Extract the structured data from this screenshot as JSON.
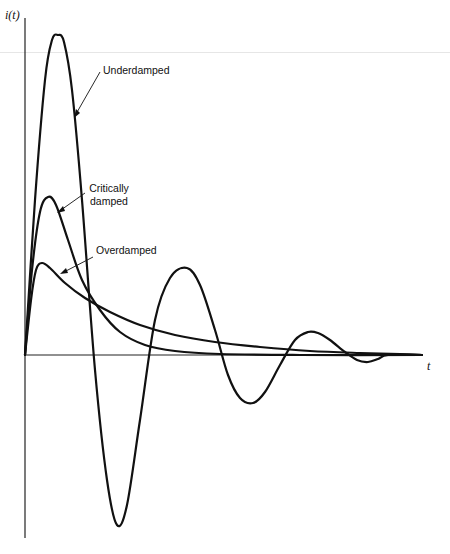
{
  "chart_data": {
    "type": "line",
    "title": "",
    "xlabel": "t",
    "ylabel": "i(t)",
    "grid": false,
    "legend": "annotations with arrows",
    "series": [
      {
        "name": "Underdamped",
        "description": "large oscillation decaying to zero",
        "points_px": [
          [
            25,
            355
          ],
          [
            35,
            200
          ],
          [
            45,
            80
          ],
          [
            52,
            40
          ],
          [
            58,
            35
          ],
          [
            64,
            42
          ],
          [
            72,
            90
          ],
          [
            82,
            200
          ],
          [
            95,
            370
          ],
          [
            107,
            480
          ],
          [
            117,
            525
          ],
          [
            127,
            505
          ],
          [
            140,
            420
          ],
          [
            155,
            320
          ],
          [
            170,
            278
          ],
          [
            187,
            268
          ],
          [
            200,
            285
          ],
          [
            215,
            330
          ],
          [
            228,
            375
          ],
          [
            240,
            398
          ],
          [
            253,
            403
          ],
          [
            265,
            392
          ],
          [
            280,
            365
          ],
          [
            295,
            340
          ],
          [
            308,
            332
          ],
          [
            318,
            333
          ],
          [
            330,
            340
          ],
          [
            345,
            352
          ],
          [
            357,
            360
          ],
          [
            368,
            362
          ],
          [
            378,
            359
          ],
          [
            388,
            355
          ],
          [
            422,
            355
          ]
        ]
      },
      {
        "name": "Critically damped",
        "description": "single peak then decays fastest",
        "points_px": [
          [
            25,
            355
          ],
          [
            32,
            270
          ],
          [
            40,
            212
          ],
          [
            48,
            197
          ],
          [
            56,
            205
          ],
          [
            68,
            240
          ],
          [
            82,
            280
          ],
          [
            100,
            310
          ],
          [
            120,
            332
          ],
          [
            145,
            345
          ],
          [
            175,
            351
          ],
          [
            220,
            354
          ],
          [
            300,
            355
          ],
          [
            422,
            355
          ]
        ]
      },
      {
        "name": "Overdamped",
        "description": "lower peak, slower decay",
        "points_px": [
          [
            25,
            355
          ],
          [
            31,
            300
          ],
          [
            36,
            270
          ],
          [
            42,
            263
          ],
          [
            50,
            268
          ],
          [
            65,
            283
          ],
          [
            85,
            298
          ],
          [
            110,
            312
          ],
          [
            140,
            325
          ],
          [
            175,
            335
          ],
          [
            215,
            342
          ],
          [
            260,
            347
          ],
          [
            310,
            351
          ],
          [
            360,
            353
          ],
          [
            400,
            354
          ],
          [
            422,
            355
          ]
        ]
      }
    ],
    "annotations": [
      "Underdamped",
      "Critically damped",
      "Overdamped"
    ],
    "axes": {
      "y_axis_label": "i(t)",
      "x_axis_label": "t"
    }
  },
  "labels": {
    "y_axis": "i(t)",
    "x_axis": "t",
    "underdamped": "Underdamped",
    "critically_line1": "Critically",
    "critically_line2": "damped",
    "overdamped": "Overdamped"
  },
  "colors": {
    "stroke": "#111111",
    "axis": "#222222",
    "background": "#ffffff"
  }
}
